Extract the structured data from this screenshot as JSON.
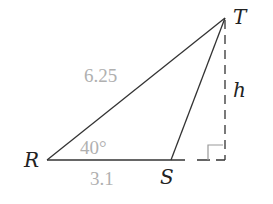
{
  "diagram": {
    "type": "triangle",
    "vertices": {
      "R": {
        "label": "R",
        "x": 47,
        "y": 160
      },
      "S": {
        "label": "S",
        "x": 171,
        "y": 160
      },
      "T": {
        "label": "T",
        "x": 225,
        "y": 18
      }
    },
    "labels": {
      "side_RT": "6.25",
      "side_RS": "3.1",
      "angle_R": "40°",
      "height": "h"
    },
    "colors": {
      "line": "#333333",
      "measure_text": "#b0b0b0",
      "vertex_text": "#222222",
      "right_angle_mark": "#999999"
    }
  }
}
